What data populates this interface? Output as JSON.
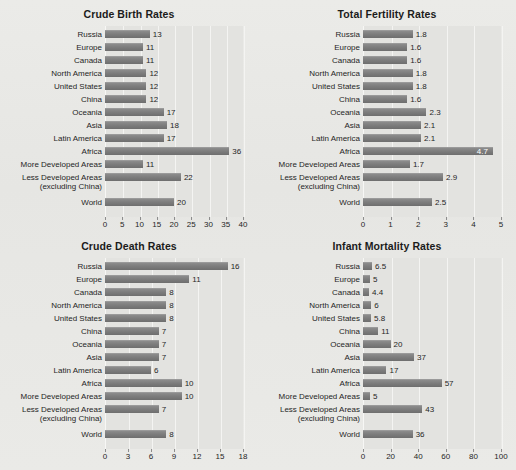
{
  "page": {
    "background_color": "#e8e8e5",
    "bar_color": "#7d7d7d",
    "plot_background_color": "#e3e3e0",
    "text_color": "#1f1f1f"
  },
  "categories": [
    "Russia",
    "Europe",
    "Canada",
    "North America",
    "United States",
    "China",
    "Oceania",
    "Asia",
    "Latin America",
    "Africa",
    "More Developed Areas",
    "Less Developed Areas",
    "World"
  ],
  "category_sublabels": {
    "Less Developed Areas": "(excluding China)"
  },
  "chart_data": [
    {
      "id": "crude-birth-rates",
      "type": "bar",
      "orientation": "horizontal",
      "title": "Crude Birth Rates",
      "xlabel": "",
      "ylabel": "",
      "grid": true,
      "legend": "none",
      "xlim": [
        0,
        40
      ],
      "xticks": [
        0,
        5,
        10,
        15,
        20,
        25,
        30,
        35,
        40
      ],
      "xtick_labels": [
        "0",
        "5",
        "10",
        "15",
        "20",
        "25",
        "30",
        "35",
        "40"
      ],
      "categories": [
        "Russia",
        "Europe",
        "Canada",
        "North America",
        "United States",
        "China",
        "Oceania",
        "Asia",
        "Latin America",
        "Africa",
        "More Developed Areas",
        "Less Developed Areas",
        "World"
      ],
      "values": [
        13,
        11,
        11,
        12,
        12,
        12,
        17,
        18,
        17,
        36,
        11,
        22,
        20
      ],
      "data_labels": [
        "13",
        "11",
        "11",
        "12",
        "12",
        "12",
        "17",
        "18",
        "17",
        "36",
        "11",
        "22",
        "20"
      ]
    },
    {
      "id": "total-fertility-rates",
      "type": "bar",
      "orientation": "horizontal",
      "title": "Total Fertility Rates",
      "xlabel": "",
      "ylabel": "",
      "grid": true,
      "legend": "none",
      "xlim": [
        0,
        5
      ],
      "xticks": [
        0,
        1,
        2,
        3,
        4,
        5
      ],
      "xtick_labels": [
        "0",
        "1",
        "2",
        "3",
        "4",
        "5"
      ],
      "categories": [
        "Russia",
        "Europe",
        "Canada",
        "North America",
        "United States",
        "China",
        "Oceania",
        "Asia",
        "Latin America",
        "Africa",
        "More Developed Areas",
        "Less Developed Areas",
        "World"
      ],
      "values": [
        1.8,
        1.6,
        1.6,
        1.8,
        1.8,
        1.6,
        2.3,
        2.1,
        2.1,
        4.7,
        1.7,
        2.9,
        2.5
      ],
      "data_labels": [
        "1.8",
        "1.6",
        "1.6",
        "1.8",
        "1.8",
        "1.6",
        "2.3",
        "2.1",
        "2.1",
        "4.7",
        "1.7",
        "2.9",
        "2.5"
      ],
      "label_inside_bar": [
        "Africa"
      ]
    },
    {
      "id": "crude-death-rates",
      "type": "bar",
      "orientation": "horizontal",
      "title": "Crude Death Rates",
      "xlabel": "",
      "ylabel": "",
      "grid": true,
      "legend": "none",
      "xlim": [
        0,
        18
      ],
      "xticks": [
        0,
        3,
        6,
        9,
        12,
        15,
        18
      ],
      "xtick_labels": [
        "0",
        "3",
        "6",
        "9",
        "12",
        "15",
        "18"
      ],
      "categories": [
        "Russia",
        "Europe",
        "Canada",
        "North America",
        "United States",
        "China",
        "Oceania",
        "Asia",
        "Latin America",
        "Africa",
        "More Developed Areas",
        "Less Developed Areas",
        "World"
      ],
      "values": [
        16,
        11,
        8,
        8,
        8,
        7,
        7,
        7,
        6,
        10,
        10,
        7,
        8
      ],
      "data_labels": [
        "16",
        "11",
        "8",
        "8",
        "8",
        "7",
        "7",
        "7",
        "6",
        "10",
        "10",
        "7",
        "8"
      ]
    },
    {
      "id": "infant-mortality-rates",
      "type": "bar",
      "orientation": "horizontal",
      "title": "Infant Mortality Rates",
      "xlabel": "",
      "ylabel": "",
      "grid": true,
      "legend": "none",
      "xlim": [
        0,
        100
      ],
      "xticks": [
        0,
        20,
        40,
        60,
        80,
        100
      ],
      "xtick_labels": [
        "0",
        "20",
        "40",
        "60",
        "80",
        "100"
      ],
      "categories": [
        "Russia",
        "Europe",
        "Canada",
        "North America",
        "United States",
        "China",
        "Oceania",
        "Asia",
        "Latin America",
        "Africa",
        "More Developed Areas",
        "Less Developed Areas",
        "World"
      ],
      "values": [
        6.5,
        5,
        4.4,
        6,
        5.8,
        11,
        20,
        37,
        17,
        57,
        5,
        43,
        36
      ],
      "data_labels": [
        "6.5",
        "5",
        "4.4",
        "6",
        "5.8",
        "11",
        "20",
        "37",
        "17",
        "57",
        "5",
        "43",
        "36"
      ]
    }
  ]
}
